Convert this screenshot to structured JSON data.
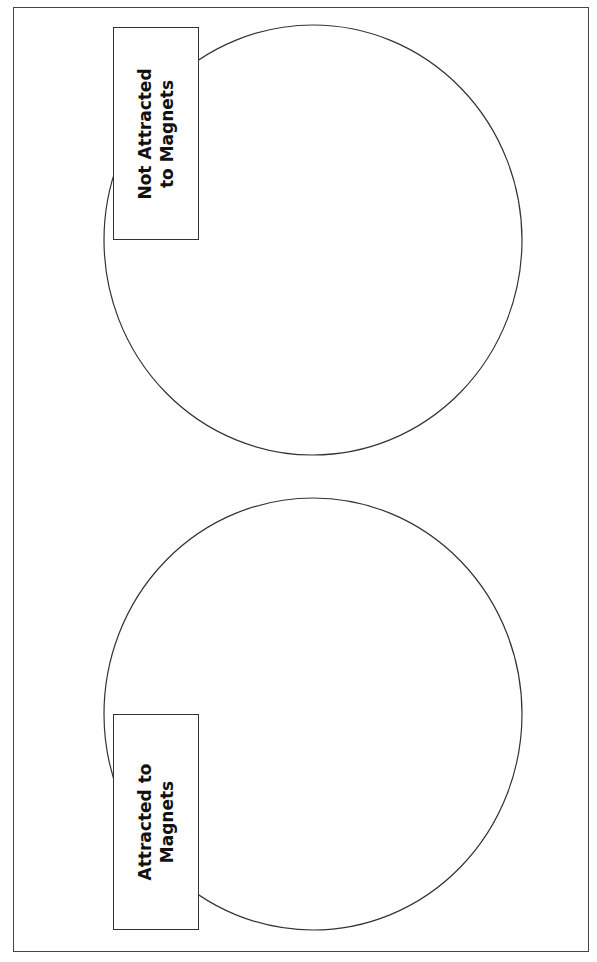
{
  "diagram": {
    "type": "two-circle sorting mat",
    "circles": [
      {
        "id": "top",
        "label": "Not Attracted\nto Magnets",
        "label_line1": "Not Attracted",
        "label_line2": "to Magnets"
      },
      {
        "id": "bottom",
        "label": "Attracted to\nMagnets",
        "label_line1": "Attracted to",
        "label_line2": "Magnets"
      }
    ],
    "colors": {
      "stroke": "#333333",
      "background": "#ffffff"
    }
  }
}
